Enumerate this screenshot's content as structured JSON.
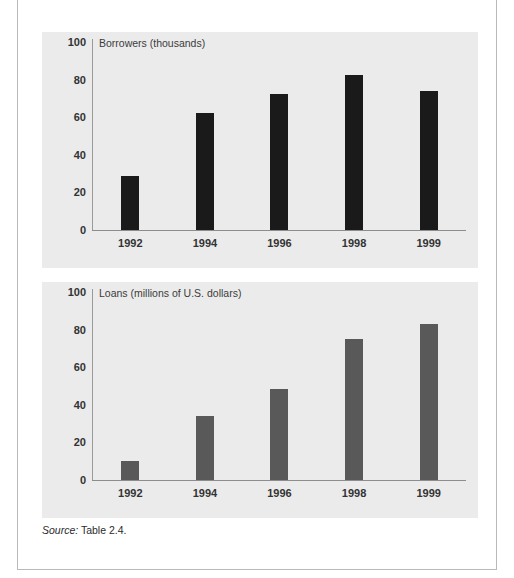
{
  "figure": {
    "source_label": "Source:",
    "source_text": "Table 2.4."
  },
  "chart_data": [
    {
      "id": "borrowers",
      "type": "bar",
      "title": "Borrowers (thousands)",
      "xlabel": "",
      "ylabel": "",
      "ylim": [
        0,
        100
      ],
      "yticks": [
        0,
        20,
        40,
        60,
        80,
        100
      ],
      "grid": false,
      "legend": "none",
      "bar_color": "#1a1a1a",
      "categories": [
        "1992",
        "1994",
        "1996",
        "1998",
        "1999"
      ],
      "values": [
        28.5,
        62,
        72.5,
        82.5,
        74
      ]
    },
    {
      "id": "loans",
      "type": "bar",
      "title": "Loans (millions of U.S. dollars)",
      "xlabel": "",
      "ylabel": "",
      "ylim": [
        0,
        100
      ],
      "yticks": [
        0,
        20,
        40,
        60,
        80,
        100
      ],
      "grid": false,
      "legend": "none",
      "bar_color": "#595959",
      "categories": [
        "1992",
        "1994",
        "1996",
        "1998",
        "1999"
      ],
      "values": [
        10,
        34,
        48.5,
        75,
        83
      ]
    }
  ]
}
